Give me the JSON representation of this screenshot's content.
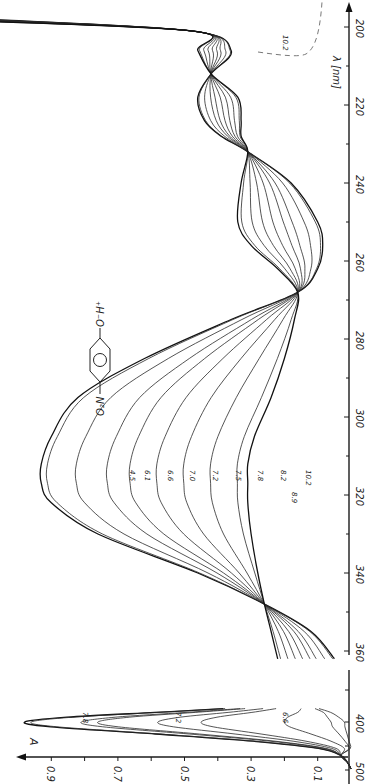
{
  "chart_data": [
    {
      "type": "line",
      "title": "UV absorption spectra of 4-nitrophenol at various pH (main panel, rotated 90°)",
      "xlabel": "λ [nm]",
      "ylabel": "A",
      "xlim": [
        200,
        360
      ],
      "x_ticks": [
        200,
        220,
        240,
        260,
        280,
        300,
        320,
        340,
        360
      ],
      "orientation": "rotated: wavelength axis vertical on right (increasing downward), absorbance increasing to the left",
      "molecule_label": "O2N–C6H4–O⁻H⁺",
      "isosbestic_points_nm": [
        201,
        212,
        232,
        268,
        348
      ],
      "series": [
        {
          "name": "4.5",
          "peak_nm": 317,
          "peak_A": 0.93
        },
        {
          "name": "6.1",
          "peak_nm": 317,
          "peak_A": 0.91
        },
        {
          "name": "6.6",
          "peak_nm": 317,
          "peak_A": 0.82
        },
        {
          "name": "7.0",
          "peak_nm": 317,
          "peak_A": 0.73
        },
        {
          "name": "7.2",
          "peak_nm": 317,
          "peak_A": 0.66
        },
        {
          "name": "7.5",
          "peak_nm": 317,
          "peak_A": 0.58
        },
        {
          "name": "7.8",
          "peak_nm": 317,
          "peak_A": 0.5
        },
        {
          "name": "8.2",
          "peak_nm": 317,
          "peak_A": 0.42
        },
        {
          "name": "8.9",
          "peak_nm": 317,
          "peak_A": 0.34
        },
        {
          "name": "10.2",
          "peak_nm": 317,
          "peak_A": 0.31
        }
      ],
      "annotations": [
        "10.2 (dashed curve near 200 nm)"
      ]
    },
    {
      "type": "line",
      "title": "Inset: 400 nm band (phenolate) vs pH",
      "xlabel": "λ [nm]",
      "ylabel": "A",
      "xlim": [
        370,
        500
      ],
      "x_ticks": [
        400,
        500
      ],
      "ylim": [
        0,
        1.0
      ],
      "y_ticks": [
        0.1,
        0.3,
        0.5,
        0.7,
        0.9
      ],
      "series": [
        {
          "name": "10.2",
          "peak_nm": 400,
          "peak_A": 0.98
        },
        {
          "name": "8.9",
          "peak_nm": 400,
          "peak_A": 0.96
        },
        {
          "name": "7.8",
          "peak_nm": 400,
          "peak_A": 0.81
        },
        {
          "name": "7.5",
          "peak_nm": 400,
          "peak_A": 0.76
        },
        {
          "name": "7.2",
          "peak_nm": 400,
          "peak_A": 0.58
        },
        {
          "name": "7.0",
          "peak_nm": 400,
          "peak_A": 0.45
        },
        {
          "name": "6.6",
          "peak_nm": 400,
          "peak_A": 0.2
        },
        {
          "name": "6.1",
          "peak_nm": 400,
          "peak_A": 0.06
        },
        {
          "name": "4.5",
          "peak_nm": 400,
          "peak_A": 0.02
        }
      ]
    }
  ],
  "axes": {
    "lambda_label": "λ [nm]",
    "lambda_ticks": [
      "200",
      "220",
      "240",
      "260",
      "280",
      "300",
      "320",
      "340",
      "360"
    ],
    "inset_lambda_ticks": [
      "400",
      "500"
    ],
    "absorbance_label": "A",
    "absorbance_ticks": [
      "0.9",
      "0.7",
      "0.5",
      "0.3",
      "0.1"
    ]
  },
  "labels": {
    "main_curves": [
      "4.5",
      "6.1",
      "6.6",
      "7.0",
      "7.2",
      "7.5",
      "7.8",
      "8.2",
      "8.9",
      "10.2"
    ],
    "dashed_curve": "10.2",
    "inset_curves": [
      "7.8",
      "7.2",
      "6.6"
    ],
    "molecule": {
      "left": "O₂N",
      "right": "O⁻H⁺"
    }
  }
}
